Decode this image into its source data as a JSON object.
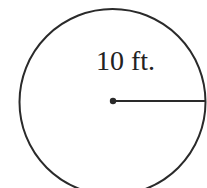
{
  "diagram": {
    "shape": "circle",
    "radius_label": "10 ft.",
    "stroke_color": "#2a2a2a",
    "background": "#ffffff"
  }
}
